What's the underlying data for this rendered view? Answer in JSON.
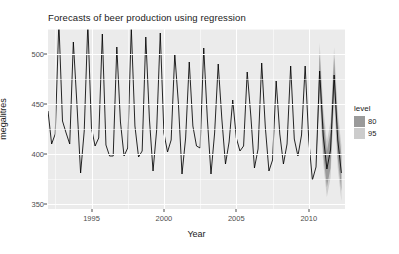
{
  "chart_data": {
    "type": "line",
    "title": "Forecasts of beer production using regression",
    "xlabel": "Year",
    "ylabel": "megalitres",
    "xlim": [
      1992.0,
      2012.5
    ],
    "ylim": [
      345,
      525
    ],
    "xticks": [
      1995,
      2000,
      2005,
      2010
    ],
    "xtick_labels": [
      "1995",
      "2000",
      "2005",
      "2010"
    ],
    "yticks": [
      350,
      400,
      450,
      500
    ],
    "ytick_labels": [
      "350",
      "400",
      "450",
      "500"
    ],
    "grid": true,
    "legend_position": "right",
    "panel_background": "#ebebeb",
    "gridline_color": "#ffffff",
    "line_color": "#000000",
    "legend": {
      "title": "level",
      "entries": [
        {
          "label": "80",
          "color": "#9a9a9a"
        },
        {
          "label": "95",
          "color": "#cccccc"
        }
      ]
    },
    "series": [
      {
        "name": "Observed beer production",
        "color": "#000000",
        "x": [
          1992.0,
          1992.25,
          1992.5,
          1992.75,
          1993.0,
          1993.25,
          1993.5,
          1993.75,
          1994.0,
          1994.25,
          1994.5,
          1994.75,
          1995.0,
          1995.25,
          1995.5,
          1995.75,
          1996.0,
          1996.25,
          1996.5,
          1996.75,
          1997.0,
          1997.25,
          1997.5,
          1997.75,
          1998.0,
          1998.25,
          1998.5,
          1998.75,
          1999.0,
          1999.25,
          1999.5,
          1999.75,
          2000.0,
          2000.25,
          2000.5,
          2000.75,
          2001.0,
          2001.25,
          2001.5,
          2001.75,
          2002.0,
          2002.25,
          2002.5,
          2002.75,
          2003.0,
          2003.25,
          2003.5,
          2003.75,
          2004.0,
          2004.25,
          2004.5,
          2004.75,
          2005.0,
          2005.25,
          2005.5,
          2005.75,
          2006.0,
          2006.25,
          2006.5,
          2006.75,
          2007.0,
          2007.25,
          2007.5,
          2007.75,
          2008.0,
          2008.25,
          2008.5,
          2008.75,
          2009.0,
          2009.25,
          2009.5,
          2009.75,
          2010.0,
          2010.25,
          2010.5
        ],
        "y": [
          443,
          410,
          420,
          532,
          433,
          421,
          410,
          512,
          449,
          381,
          423,
          531,
          426,
          408,
          416,
          520,
          409,
          398,
          398,
          507,
          432,
          398,
          406,
          526,
          428,
          397,
          403,
          517,
          435,
          383,
          424,
          521,
          421,
          402,
          414,
          500,
          451,
          380,
          416,
          492,
          428,
          408,
          406,
          506,
          435,
          380,
          421,
          490,
          435,
          390,
          412,
          454,
          416,
          403,
          408,
          482,
          438,
          386,
          405,
          491,
          427,
          383,
          394,
          473,
          420,
          390,
          410,
          488,
          415,
          398,
          419,
          488,
          414,
          374,
          387
        ]
      },
      {
        "name": "Forecast mean",
        "color": "#000000",
        "x": [
          2010.5,
          2010.75,
          2011.0,
          2011.25,
          2011.5,
          2011.75,
          2012.0,
          2012.25
        ],
        "y": [
          387,
          483,
          418,
          385,
          404,
          479,
          414,
          381
        ]
      }
    ],
    "forecast_intervals": {
      "start_x": 2010.5,
      "end_x": 2012.25,
      "levels": [
        {
          "level": 80,
          "color": "#9a9a9a",
          "lower": [
            387,
            465,
            400,
            367,
            386,
            461,
            396,
            363
          ],
          "upper": [
            387,
            501,
            436,
            403,
            422,
            497,
            432,
            399
          ]
        },
        {
          "level": 95,
          "color": "#cccccc",
          "lower": [
            387,
            455,
            390,
            357,
            376,
            451,
            386,
            353
          ],
          "upper": [
            387,
            511,
            446,
            413,
            432,
            507,
            442,
            409
          ]
        }
      ]
    }
  }
}
